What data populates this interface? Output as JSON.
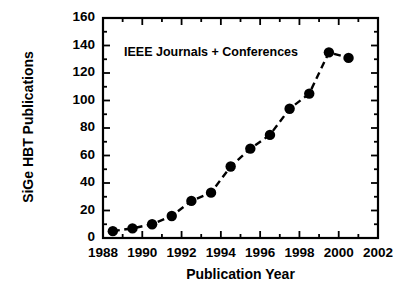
{
  "chart_data": {
    "type": "line",
    "title": "",
    "annotation": "IEEE Journals + Conferences",
    "xlabel": "Publication Year",
    "ylabel": "SiGe HBT Publications",
    "xlim": [
      1988,
      2002
    ],
    "ylim": [
      0,
      160
    ],
    "xticks": [
      1988,
      1990,
      1992,
      1994,
      1996,
      1998,
      2000,
      2002
    ],
    "xtick_labels": [
      "1988",
      "1990",
      "1992",
      "1994",
      "1996",
      "1998",
      "2000",
      "2002"
    ],
    "x_minor_interval": 1,
    "yticks": [
      0,
      20,
      40,
      60,
      80,
      100,
      120,
      140,
      160
    ],
    "ytick_labels": [
      "0",
      "20",
      "40",
      "60",
      "80",
      "100",
      "120",
      "140",
      "160"
    ],
    "y_minor_interval": 10,
    "grid": false,
    "legend": null,
    "marker": "filled-circle",
    "marker_color": "#000000",
    "line_color": "#000000",
    "line_style": "dashed",
    "x": [
      1988.5,
      1989.5,
      1990.5,
      1991.5,
      1992.5,
      1993.5,
      1994.5,
      1995.5,
      1996.5,
      1997.5,
      1998.5,
      1999.5,
      2000.5
    ],
    "values": [
      5,
      7,
      10,
      16,
      27,
      33,
      52,
      65,
      75,
      94,
      105,
      135,
      131
    ],
    "series": [
      {
        "name": "SiGe HBT Publications",
        "x": [
          1988.5,
          1989.5,
          1990.5,
          1991.5,
          1992.5,
          1993.5,
          1994.5,
          1995.5,
          1996.5,
          1997.5,
          1998.5,
          1999.5,
          2000.5
        ],
        "values": [
          5,
          7,
          10,
          16,
          27,
          33,
          52,
          65,
          75,
          94,
          105,
          135,
          131
        ]
      }
    ]
  },
  "figure": {
    "background": "#ffffff",
    "axis_color": "#000000"
  }
}
